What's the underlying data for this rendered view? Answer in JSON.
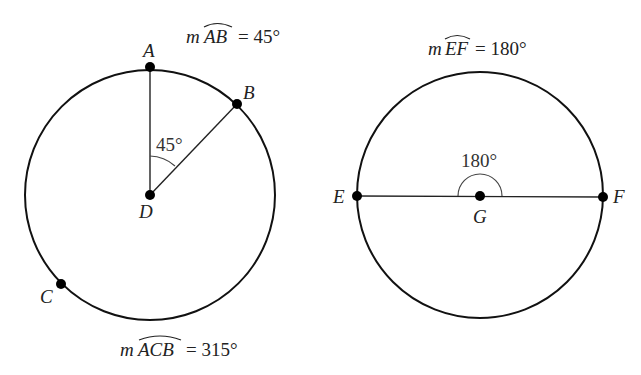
{
  "figure_left": {
    "title": {
      "prefix": "m",
      "arc": "AB",
      "rest": "= 45°"
    },
    "bottom_caption": {
      "prefix": "m",
      "arc": "ACB",
      "rest": "= 315°"
    },
    "points": {
      "A": "A",
      "B": "B",
      "C": "C",
      "D": "D"
    },
    "angle_label": "45°",
    "circle": {
      "cx": 150,
      "cy": 195,
      "r": 125
    }
  },
  "figure_right": {
    "title": {
      "prefix": "m",
      "arc": "EF",
      "rest": "= 180°"
    },
    "points": {
      "E": "E",
      "F": "F",
      "G": "G"
    },
    "angle_label": "180°",
    "circle": {
      "cx": 480,
      "cy": 195,
      "r": 123
    }
  },
  "colors": {
    "stroke": "#111111",
    "background": "#ffffff"
  }
}
